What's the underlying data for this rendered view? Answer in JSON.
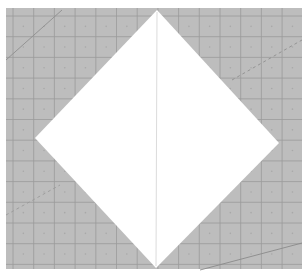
{
  "scene": {
    "description": "Photo of a white square paper folded into a diamond on a gray gridded cutting mat",
    "width": 308,
    "height": 277,
    "background_color": "#ffffff",
    "mat": {
      "color": "#bdbdbd",
      "grid_color": "#9a9a9a",
      "dot_color": "#a8a8a8",
      "x": 6,
      "y": 8,
      "width": 296,
      "height": 261,
      "grid_start_x": 13,
      "grid_start_y": 16,
      "grid_step": 20.7
    },
    "paper": {
      "color": "#ffffff",
      "points": [
        [
          157,
          10
        ],
        [
          279,
          143
        ],
        [
          156,
          268
        ],
        [
          35,
          138
        ]
      ],
      "crease": {
        "x1": 157,
        "y1": 12,
        "x2": 156,
        "y2": 266,
        "color": "#dcdcdc"
      }
    },
    "mat_lines": [
      {
        "x1": 6,
        "y1": 60,
        "x2": 62,
        "y2": 10,
        "color": "#8f8f8f",
        "dashed": false
      },
      {
        "x1": 232,
        "y1": 80,
        "x2": 302,
        "y2": 40,
        "color": "#8f8f8f",
        "dashed": true
      },
      {
        "x1": 6,
        "y1": 215,
        "x2": 60,
        "y2": 185,
        "color": "#9a9a9a",
        "dashed": true
      },
      {
        "x1": 200,
        "y1": 270,
        "x2": 302,
        "y2": 243,
        "color": "#8a8a8a",
        "dashed": false
      }
    ]
  }
}
